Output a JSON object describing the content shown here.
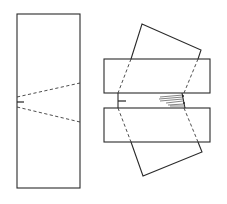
{
  "figure": {
    "panels": [
      {
        "id": "unloaded",
        "label": "",
        "elements": [
          "specimen-body",
          "notch",
          "dashed-wedge-lines"
        ]
      },
      {
        "id": "loaded",
        "label": "",
        "elements": [
          "upper-support-block",
          "lower-support-block",
          "rotated-specimen",
          "notch",
          "crack-fan"
        ]
      }
    ],
    "colors": {
      "line": "#2a2a2a",
      "background": "#ffffff"
    }
  }
}
